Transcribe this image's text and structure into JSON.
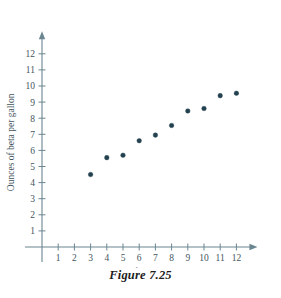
{
  "caption": "Figure 7.25",
  "chart_data": {
    "type": "scatter",
    "title": "",
    "xlabel": "Ounces of alpha per gallon",
    "ylabel": "Ounces of beta per gallon",
    "xlim": [
      0,
      13
    ],
    "ylim": [
      0,
      13
    ],
    "xticks": [
      1,
      2,
      3,
      4,
      5,
      6,
      7,
      8,
      9,
      10,
      11,
      12
    ],
    "yticks": [
      1,
      2,
      3,
      4,
      5,
      6,
      7,
      8,
      9,
      10,
      11,
      12
    ],
    "xtick_labels": [
      "1",
      "2",
      "3",
      "4",
      "5",
      "6",
      "7",
      "8",
      "9",
      "10",
      "11",
      "12"
    ],
    "ytick_labels": [
      "1",
      "2",
      "3",
      "4",
      "5",
      "6",
      "7",
      "8",
      "9",
      "10",
      "11",
      "12"
    ],
    "grid": false,
    "legend": false,
    "point_color": "#23414f",
    "axis_color": "#6b8691",
    "points": [
      {
        "x": 3,
        "y": 4.5
      },
      {
        "x": 4,
        "y": 5.55
      },
      {
        "x": 5,
        "y": 5.7
      },
      {
        "x": 6,
        "y": 6.6
      },
      {
        "x": 7,
        "y": 6.95
      },
      {
        "x": 8,
        "y": 7.55
      },
      {
        "x": 9,
        "y": 8.45
      },
      {
        "x": 10,
        "y": 8.6
      },
      {
        "x": 11,
        "y": 9.4
      },
      {
        "x": 12,
        "y": 9.55
      }
    ]
  }
}
